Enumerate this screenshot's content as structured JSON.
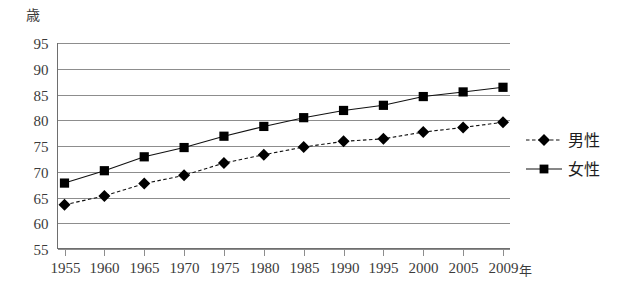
{
  "chart_data": {
    "type": "line",
    "title": "",
    "subtitle": "",
    "xlabel": "年",
    "ylabel": "歳",
    "x": [
      1955,
      1960,
      1965,
      1970,
      1975,
      1980,
      1985,
      1990,
      1995,
      2000,
      2005,
      2009
    ],
    "categories": [
      "1955",
      "1960",
      "1965",
      "1970",
      "1975",
      "1980",
      "1985",
      "1990",
      "1995",
      "2000",
      "2005",
      "2009"
    ],
    "xlim": [
      1955,
      2009
    ],
    "ylim": [
      55,
      95
    ],
    "yticks": [
      55,
      60,
      65,
      70,
      75,
      80,
      85,
      90,
      95
    ],
    "ytick_labels": [
      "55",
      "60",
      "65",
      "70",
      "75",
      "80",
      "85",
      "90",
      "95"
    ],
    "grid": true,
    "legend_position": "right",
    "series": [
      {
        "name": "男性",
        "marker": "diamond",
        "linestyle": "dashed",
        "color": "#000000",
        "values": [
          63.6,
          65.3,
          67.7,
          69.3,
          71.7,
          73.3,
          74.8,
          75.9,
          76.4,
          77.7,
          78.6,
          79.6
        ]
      },
      {
        "name": "女性",
        "marker": "square",
        "linestyle": "solid",
        "color": "#000000",
        "values": [
          67.8,
          70.2,
          72.9,
          74.7,
          76.9,
          78.8,
          80.5,
          81.9,
          82.9,
          84.6,
          85.5,
          86.4
        ]
      }
    ]
  },
  "axis": {
    "y_unit": "歳",
    "x_unit": "年"
  },
  "legend": {
    "items": [
      {
        "label": "男性",
        "marker": "diamond",
        "linestyle": "dashed"
      },
      {
        "label": "女性",
        "marker": "square",
        "linestyle": "solid"
      }
    ]
  }
}
